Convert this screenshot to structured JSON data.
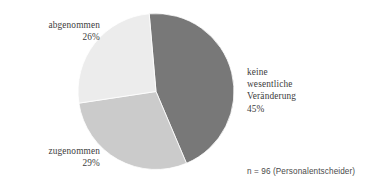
{
  "chart_data": {
    "type": "pie",
    "title": "",
    "subtitle": "",
    "xlabel": "",
    "ylabel": "",
    "legend_position": "none",
    "grid": false,
    "units": "percent",
    "start_angle_deg": -5,
    "direction": "clockwise",
    "categories": [
      "keine wesentliche Veränderung",
      "zugenommen",
      "abgenommen"
    ],
    "values": [
      45,
      29,
      26
    ],
    "slices": [
      {
        "label": "keine wesentliche Veränderung",
        "label_lines": [
          "keine",
          "wesentliche",
          "Veränderung"
        ],
        "value": 45,
        "value_text": "45%",
        "color": "#787878",
        "label_position": "right"
      },
      {
        "label": "zugenommen",
        "label_lines": [
          "zugenommen"
        ],
        "value": 29,
        "value_text": "29%",
        "color": "#cbcbcb",
        "label_position": "bottom-left"
      },
      {
        "label": "abgenommen",
        "label_lines": [
          "abgenommen"
        ],
        "value": 26,
        "value_text": "26%",
        "color": "#ececec",
        "label_position": "top-left"
      }
    ],
    "annotations": [
      "n = 96 (Personalentscheider)"
    ]
  },
  "labels": {
    "abgenommen": {
      "name": "abgenommen",
      "value": "26%"
    },
    "zugenommen": {
      "name": "zugenommen",
      "value": "29%"
    },
    "keine": {
      "name": "keine wesentliche Veränderung",
      "value": "45%"
    }
  },
  "footnote": {
    "text": "n = 96 (Personalentscheider)"
  },
  "colors": {
    "background": "#ffffff",
    "text": "#3c3c3c",
    "slice_dark": "#787878",
    "slice_mid": "#cbcbcb",
    "slice_light": "#ececec",
    "slice_border": "#ffffff"
  },
  "geometry": {
    "center_x": 156,
    "center_y": 91.5,
    "radius": 78
  }
}
